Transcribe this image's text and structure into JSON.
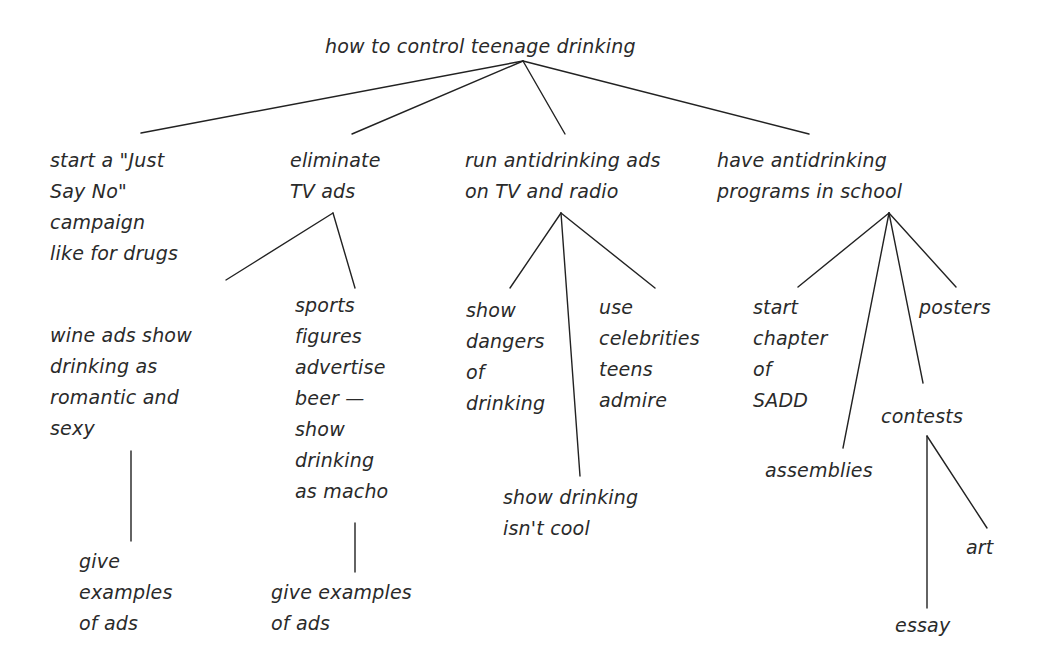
{
  "diagram": {
    "type": "tree",
    "title": "how to control teenage drinking",
    "line_color": "#222222",
    "text_color": "#2a2a2a",
    "background": "#ffffff",
    "nodes": {
      "root": {
        "text": "how to control teenage drinking"
      },
      "just_say_no": {
        "text": "start a \"Just\nSay No\"\ncampaign\nlike for drugs"
      },
      "eliminate_tv_ads": {
        "text": "eliminate\nTV ads"
      },
      "wine_ads": {
        "text": "wine ads show\ndrinking as\nromantic and\nsexy"
      },
      "wine_examples": {
        "text": "give\nexamples\nof ads"
      },
      "sports_figures": {
        "text": "sports\nfigures\nadvertise\nbeer —\nshow\ndrinking\nas macho"
      },
      "sports_examples": {
        "text": "give examples\nof ads"
      },
      "run_ads": {
        "text": "run antidrinking ads\non TV and radio"
      },
      "show_dangers": {
        "text": "show\ndangers\nof\ndrinking"
      },
      "use_celebrities": {
        "text": "use\ncelebrities\nteens\nadmire"
      },
      "not_cool": {
        "text": "show drinking\nisn't cool"
      },
      "school_programs": {
        "text": "have antidrinking\nprograms in school"
      },
      "sadd": {
        "text": "start\nchapter\nof\nSADD"
      },
      "assemblies": {
        "text": "assemblies"
      },
      "posters": {
        "text": "posters"
      },
      "contests": {
        "text": "contests"
      },
      "art": {
        "text": "art"
      },
      "essay": {
        "text": "essay"
      }
    },
    "edges": [
      [
        "root",
        "just_say_no"
      ],
      [
        "root",
        "eliminate_tv_ads"
      ],
      [
        "root",
        "run_ads"
      ],
      [
        "root",
        "school_programs"
      ],
      [
        "eliminate_tv_ads",
        "wine_ads"
      ],
      [
        "eliminate_tv_ads",
        "sports_figures"
      ],
      [
        "wine_ads",
        "wine_examples"
      ],
      [
        "sports_figures",
        "sports_examples"
      ],
      [
        "run_ads",
        "show_dangers"
      ],
      [
        "run_ads",
        "not_cool"
      ],
      [
        "run_ads",
        "use_celebrities"
      ],
      [
        "school_programs",
        "sadd"
      ],
      [
        "school_programs",
        "assemblies"
      ],
      [
        "school_programs",
        "contests"
      ],
      [
        "school_programs",
        "posters"
      ],
      [
        "contests",
        "essay"
      ],
      [
        "contests",
        "art"
      ]
    ]
  }
}
